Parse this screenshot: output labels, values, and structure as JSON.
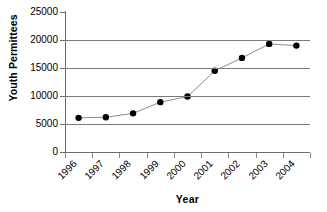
{
  "chart_data": {
    "type": "line",
    "title": "",
    "xlabel": "Year",
    "ylabel": "Youth Permittees",
    "categories": [
      "1996",
      "1997",
      "1998",
      "1999",
      "2000",
      "2001",
      "2002",
      "2003",
      "2004"
    ],
    "values": [
      6100,
      6200,
      6900,
      8900,
      9900,
      14500,
      16800,
      19300,
      19000
    ],
    "series": [
      {
        "name": "Youth Permittees",
        "values": [
          6100,
          6200,
          6900,
          8900,
          9900,
          14500,
          16800,
          19300,
          19000
        ]
      }
    ],
    "ylim": [
      0,
      25000
    ],
    "y_ticks": [
      0,
      5000,
      10000,
      15000,
      20000,
      25000
    ],
    "y_tick_labels": [
      "0",
      "5000",
      "10000",
      "15000",
      "20000",
      "25000"
    ],
    "grid": "horizontal",
    "legend": "none",
    "marker": "filled-circle",
    "marker_color": "#000000",
    "line_color": "#808080",
    "gridline_color": "#7a7a7a",
    "background_color": "#ffffff",
    "x_tick_label_rotation": -45
  },
  "axes": {
    "y_title": "Youth Permittees",
    "x_title": "Year"
  }
}
